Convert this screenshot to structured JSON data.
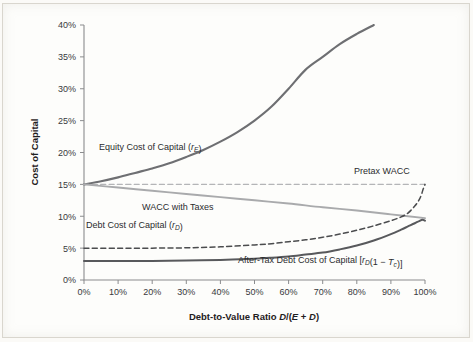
{
  "figure": {
    "background_color": "#fdfdfb",
    "axis_color": "#8b8c8e"
  },
  "chart_data": {
    "type": "line",
    "title": "",
    "xlabel_plain": "Debt-to-Value Ratio D/(E + D)",
    "xlabel_prefix": "Debt-to-Value Ratio ",
    "xlabel_math_d": "D",
    "xlabel_math_slash": "/(",
    "xlabel_math_e": "E",
    "xlabel_math_plus": " + ",
    "xlabel_math_d2": "D",
    "xlabel_math_close": ")",
    "ylabel": "Cost of Capital",
    "xlim": [
      0,
      100
    ],
    "ylim": [
      0,
      40
    ],
    "grid": false,
    "legend_position": "inline-annotations",
    "xticks": [
      "0%",
      "10%",
      "20%",
      "30%",
      "40%",
      "50%",
      "60%",
      "70%",
      "80%",
      "90%",
      "100%"
    ],
    "xtick_values": [
      0,
      10,
      20,
      30,
      40,
      50,
      60,
      70,
      80,
      90,
      100
    ],
    "yticks": [
      "0%",
      "5%",
      "10%",
      "15%",
      "20%",
      "25%",
      "30%",
      "35%",
      "40%"
    ],
    "ytick_values": [
      0,
      5,
      10,
      15,
      20,
      25,
      30,
      35,
      40
    ],
    "x": [
      0,
      5,
      10,
      15,
      20,
      25,
      30,
      35,
      40,
      45,
      50,
      55,
      60,
      65,
      70,
      75,
      80,
      85,
      90,
      95,
      98,
      100
    ],
    "series": [
      {
        "name": "Equity Cost of Capital",
        "label_text": "Equity Cost of Capital (",
        "label_math": "r",
        "label_sub": "E",
        "label_close": ")",
        "style": "solid",
        "color": "#6e6f72",
        "width": 2.1,
        "x": [
          0,
          5,
          10,
          15,
          20,
          25,
          30,
          35,
          40,
          45,
          50,
          55,
          60,
          65,
          70,
          75,
          80,
          85
        ],
        "values": [
          15.0,
          15.5,
          16.1,
          16.8,
          17.5,
          18.3,
          19.3,
          20.4,
          21.7,
          23.2,
          25.0,
          27.2,
          30.0,
          33.0,
          35.0,
          37.0,
          38.6,
          40.0
        ]
      },
      {
        "name": "Pretax WACC",
        "label_text": "Pretax WACC",
        "style": "dashed",
        "color": "#b4b5b7",
        "width": 1.3,
        "x": [
          0,
          100
        ],
        "values": [
          15.0,
          15.0
        ]
      },
      {
        "name": "WACC with Taxes",
        "label_text": "WACC with Taxes",
        "style": "solid",
        "color": "#a9aaac",
        "width": 1.9,
        "x": [
          0,
          10,
          20,
          30,
          40,
          50,
          60,
          70,
          80,
          90,
          100
        ],
        "values": [
          15.0,
          14.5,
          14.0,
          13.5,
          13.0,
          12.5,
          12.0,
          11.4,
          10.9,
          10.3,
          9.7
        ]
      },
      {
        "name": "Debt Cost of Capital",
        "label_text": "Debt Cost of Capital (",
        "label_math": "r",
        "label_sub": "D",
        "label_close": ")",
        "style": "dashed",
        "color": "#4b4c4e",
        "width": 1.5,
        "x": [
          0,
          10,
          20,
          30,
          40,
          50,
          55,
          60,
          65,
          70,
          75,
          80,
          85,
          90,
          93,
          95,
          97,
          98.5,
          99.5,
          100
        ],
        "values": [
          5.0,
          5.0,
          5.0,
          5.05,
          5.2,
          5.5,
          5.7,
          6.0,
          6.3,
          6.7,
          7.2,
          7.8,
          8.5,
          9.3,
          9.9,
          10.5,
          11.6,
          12.8,
          14.3,
          15.0
        ]
      },
      {
        "name": "After-Tax Debt Cost of Capital",
        "label_text": "After-Tax Debt Cost of Capital [",
        "label_math": "r",
        "label_sub": "D",
        "label_mid": "(1 − ",
        "label_math2": "T",
        "label_sub2": "c",
        "label_close": ")]",
        "style": "solid",
        "color": "#58595c",
        "width": 2.0,
        "x": [
          0,
          10,
          20,
          30,
          40,
          50,
          55,
          60,
          65,
          70,
          75,
          80,
          85,
          90,
          93,
          95,
          97,
          98.3,
          99.2,
          100
        ],
        "values": [
          3.0,
          3.0,
          3.0,
          3.05,
          3.15,
          3.35,
          3.5,
          3.7,
          4.0,
          4.3,
          4.8,
          5.4,
          6.2,
          7.2,
          7.9,
          8.4,
          8.9,
          9.25,
          9.45,
          9.3
        ]
      }
    ]
  },
  "annotations": {
    "equity": "Equity Cost of Capital (rE)",
    "pretax_wacc": "Pretax WACC",
    "wacc_taxes": "WACC with Taxes",
    "debt": "Debt Cost of Capital (rD)",
    "after_tax_debt": "After-Tax Debt Cost of Capital [rD(1 − Tc)]"
  }
}
